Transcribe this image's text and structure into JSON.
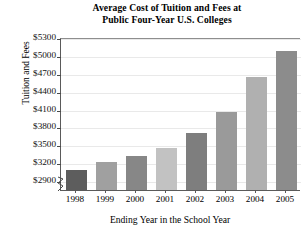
{
  "chart_data": {
    "type": "bar",
    "title": "Average Cost of Tuition and Fees at Public Four-Year U.S. Colleges",
    "title_line1": "Average Cost of Tuition and Fees at",
    "title_line2": "Public Four-Year U.S. Colleges",
    "xlabel": "Ending Year in the School Year",
    "ylabel": "Tuition and Fees",
    "categories": [
      "1998",
      "1999",
      "2000",
      "2001",
      "2002",
      "2003",
      "2004",
      "2005"
    ],
    "values": [
      3110,
      3230,
      3340,
      3470,
      3720,
      4070,
      4660,
      5100
    ],
    "ylim": [
      2750,
      5300
    ],
    "ytick_values": [
      2900,
      3200,
      3500,
      3800,
      4100,
      4400,
      4700,
      5000,
      5300
    ],
    "ytick_labels": [
      "$2900",
      "$3200",
      "$3500",
      "$3800",
      "$4100",
      "$4400",
      "$4700",
      "$5000",
      "$5300"
    ],
    "grid": true,
    "legend": "none",
    "axis_break": true,
    "bar_colors": [
      "#5d5d5d",
      "#a0a0a0",
      "#878787",
      "#c2c2c2",
      "#7e7e7e",
      "#9a9a9a",
      "#b0b0b0",
      "#8c8c8c"
    ]
  }
}
